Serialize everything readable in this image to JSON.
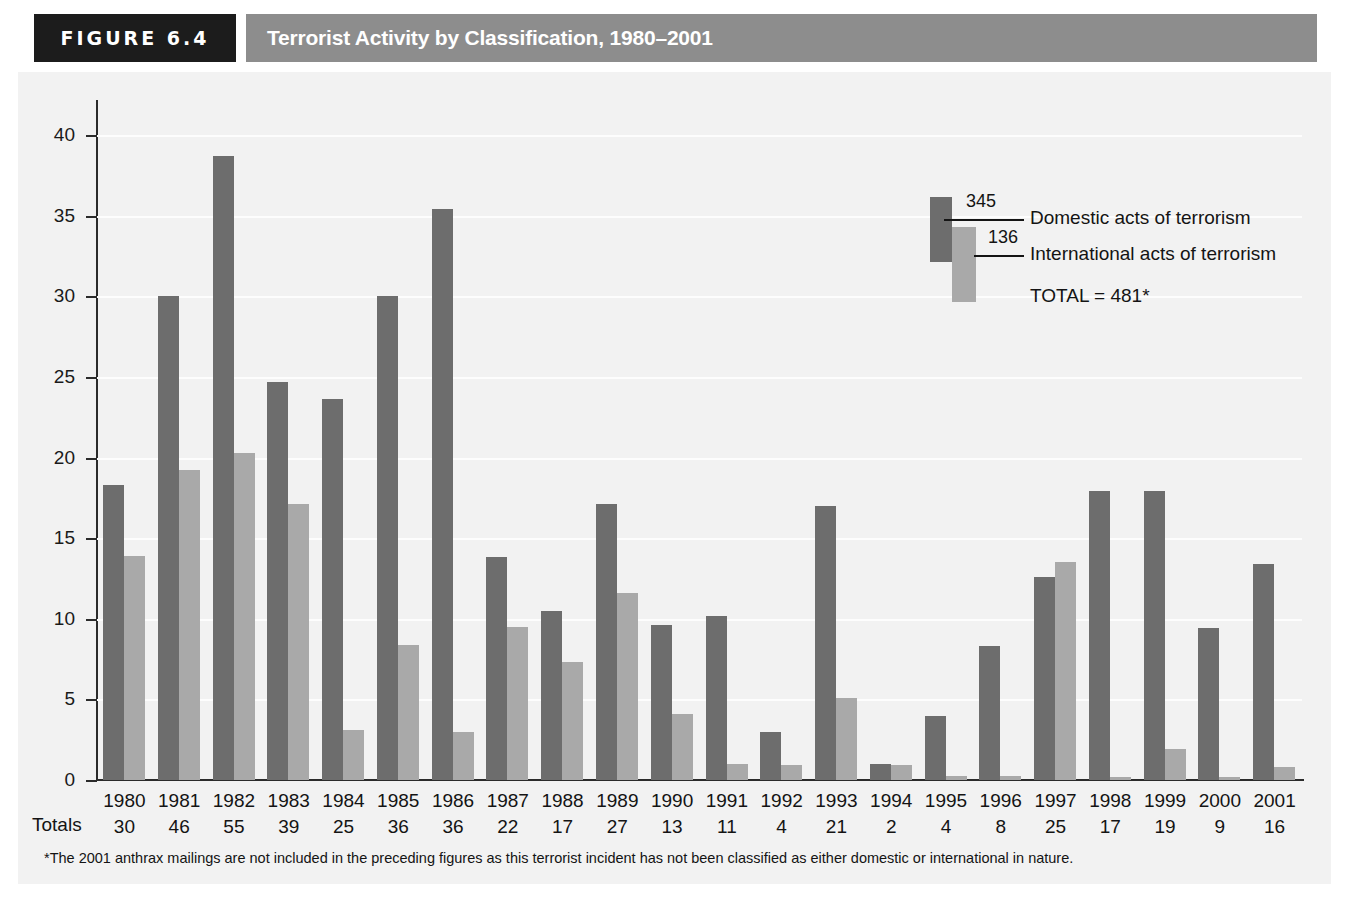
{
  "header": {
    "figure_tag": "FIGURE 6.4",
    "title": "Terrorist Activity by Classification, 1980–2001"
  },
  "legend": {
    "domestic_value": "345",
    "domestic_label": "Domestic acts of terrorism",
    "international_value": "136",
    "international_label": "International acts of terrorism",
    "total_label": "TOTAL = 481*"
  },
  "totals_row_label": "Totals",
  "footnote": "*The 2001 anthrax mailings are not included in the preceding figures as this terrorist incident has not been classified as either domestic or international in nature.",
  "colors": {
    "domestic": "#6d6d6d",
    "international": "#a9a9a9",
    "header_band": "#8d8d8d",
    "figure_tag_bg": "#1c1c1c",
    "plot_bg": "#f2f2f2",
    "axis": "#2b2b2b",
    "gridline": "#fdfdfd"
  },
  "chart_data": {
    "type": "bar",
    "title": "Terrorist Activity by Classification, 1980–2001",
    "xlabel": "",
    "ylabel": "",
    "ylim": [
      0,
      40
    ],
    "yticks": [
      0,
      5,
      10,
      15,
      20,
      25,
      30,
      35,
      40
    ],
    "grid": true,
    "legend_position": "upper-right",
    "categories": [
      "1980",
      "1981",
      "1982",
      "1983",
      "1984",
      "1985",
      "1986",
      "1987",
      "1988",
      "1989",
      "1990",
      "1991",
      "1992",
      "1993",
      "1994",
      "1995",
      "1996",
      "1997",
      "1998",
      "1999",
      "2000",
      "2001"
    ],
    "series": [
      {
        "name": "Domestic acts of terrorism",
        "color": "#6d6d6d",
        "total": 345,
        "values": [
          18.3,
          30.0,
          38.7,
          24.7,
          23.6,
          30.0,
          35.4,
          13.8,
          10.5,
          17.1,
          9.6,
          10.2,
          3.0,
          17.0,
          1.0,
          4.0,
          8.3,
          12.6,
          17.9,
          17.9,
          9.4,
          13.4
        ]
      },
      {
        "name": "International acts of terrorism",
        "color": "#a9a9a9",
        "total": 136,
        "values": [
          13.9,
          19.2,
          20.3,
          17.1,
          3.1,
          8.4,
          3.0,
          9.5,
          7.3,
          11.6,
          4.1,
          1.0,
          0.95,
          5.1,
          0.95,
          0.25,
          0.25,
          13.5,
          0.2,
          1.9,
          0.2,
          0.8
        ]
      }
    ],
    "annotations": {
      "totals_row_header": "Totals",
      "totals": [
        30,
        46,
        55,
        39,
        25,
        36,
        36,
        22,
        17,
        27,
        13,
        11,
        4,
        21,
        2,
        4,
        8,
        25,
        17,
        19,
        9,
        16
      ],
      "grand_total": "TOTAL = 481*"
    }
  }
}
